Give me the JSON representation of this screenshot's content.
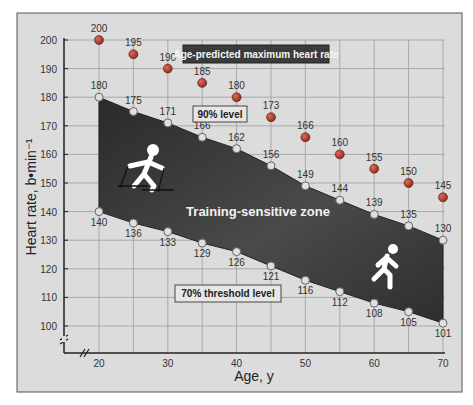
{
  "chart_data": {
    "type": "line",
    "title": "",
    "xlabel": "Age, y",
    "ylabel": "Heart rate, b•min⁻¹",
    "xlim": [
      15,
      70
    ],
    "ylim": [
      95,
      200
    ],
    "x_ticks": [
      20,
      30,
      40,
      50,
      60,
      70
    ],
    "y_ticks": [
      100,
      110,
      120,
      130,
      140,
      150,
      160,
      170,
      180,
      190,
      200
    ],
    "grid": true,
    "axis_breaks": true,
    "x": [
      20,
      25,
      30,
      35,
      40,
      45,
      50,
      55,
      60,
      65,
      70
    ],
    "series": [
      {
        "name": "Age-predicted maximum heart rate",
        "values": [
          200,
          195,
          190,
          185,
          180,
          173,
          166,
          160,
          155,
          150,
          145
        ],
        "marker": "filled-dot",
        "color": "#c0392b"
      },
      {
        "name": "90% level",
        "values": [
          180,
          175,
          171,
          166,
          162,
          156,
          149,
          144,
          139,
          135,
          130
        ],
        "marker": "open-dot",
        "color": "#e8e8e8"
      },
      {
        "name": "70% threshold level",
        "values": [
          140,
          136,
          133,
          129,
          126,
          121,
          116,
          112,
          108,
          105,
          101
        ],
        "marker": "open-dot",
        "color": "#e8e8e8"
      }
    ],
    "annotations": [
      {
        "text": "Age-predicted maximum heart rate",
        "style": "dark-box"
      },
      {
        "text": "90% level",
        "style": "light-box"
      },
      {
        "text": "70% threshold level",
        "style": "light-box"
      },
      {
        "text": "Training-sensitive zone",
        "style": "zone-label"
      }
    ],
    "shaded_region": {
      "between": [
        "90% level",
        "70% threshold level"
      ],
      "label": "Training-sensitive zone",
      "color": "#3a3a3a"
    },
    "icons": [
      "cross-country-skier-icon",
      "runner-icon"
    ]
  },
  "labels": {
    "max_hr": "Age-predicted maximum heart rate",
    "level90": "90% level",
    "level70": "70% threshold level",
    "zone": "Training-sensitive zone",
    "xlabel": "Age, y",
    "ylabel": "Heart rate, b•min⁻¹"
  },
  "colors": {
    "panel": "#d9d9d9",
    "panel_border": "#555555",
    "grid": "#a8a8a8",
    "zone": "#333333",
    "max_dot": "#b03a2e",
    "level_dot": "#e0e0e0",
    "max_box": "#3b3b3b"
  }
}
